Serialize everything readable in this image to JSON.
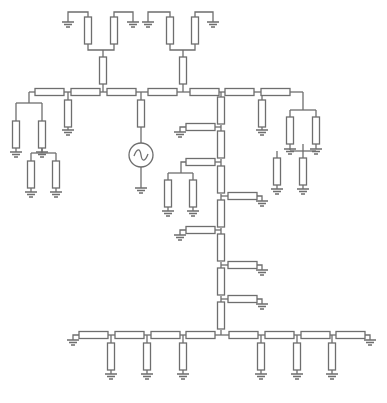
{
  "diagram": {
    "title": "",
    "type": "resistor-ladder-network",
    "stroke_color": "#6e6e6e",
    "background": "#ffffff",
    "source": {
      "kind": "ac-voltage-source",
      "cx": 141,
      "cy": 155,
      "r": 12
    },
    "resistors_h": [
      [
        35,
        92
      ],
      [
        71,
        92
      ],
      [
        107,
        92
      ],
      [
        148,
        92
      ],
      [
        190,
        92
      ],
      [
        225,
        92
      ],
      [
        261,
        92
      ],
      [
        186,
        127
      ],
      [
        186,
        162
      ],
      [
        228,
        196
      ],
      [
        186,
        230
      ],
      [
        228,
        265
      ],
      [
        228,
        299
      ],
      [
        79,
        335
      ],
      [
        115,
        335
      ],
      [
        151,
        335
      ],
      [
        186,
        335
      ],
      [
        229,
        335
      ],
      [
        265,
        335
      ],
      [
        301,
        335
      ],
      [
        336,
        335
      ]
    ],
    "resistors_v": [
      [
        88,
        17
      ],
      [
        114,
        17
      ],
      [
        170,
        17
      ],
      [
        195,
        17
      ],
      [
        103,
        57
      ],
      [
        183,
        57
      ],
      [
        16,
        121
      ],
      [
        42,
        121
      ],
      [
        68,
        100
      ],
      [
        141,
        100
      ],
      [
        31,
        161
      ],
      [
        56,
        161
      ],
      [
        221,
        97
      ],
      [
        221,
        131
      ],
      [
        221,
        166
      ],
      [
        221,
        200
      ],
      [
        221,
        234
      ],
      [
        221,
        268
      ],
      [
        221,
        302
      ],
      [
        168,
        180
      ],
      [
        193,
        180
      ],
      [
        262,
        100
      ],
      [
        290,
        117
      ],
      [
        316,
        117
      ],
      [
        277,
        158
      ],
      [
        303,
        158
      ],
      [
        111,
        343
      ],
      [
        147,
        343
      ],
      [
        183,
        343
      ],
      [
        261,
        343
      ],
      [
        297,
        343
      ],
      [
        332,
        343
      ]
    ],
    "grounds": [
      [
        68,
        22
      ],
      [
        133,
        22
      ],
      [
        148,
        22
      ],
      [
        213,
        22
      ],
      [
        16,
        152
      ],
      [
        42,
        152
      ],
      [
        68,
        130
      ],
      [
        141,
        188
      ],
      [
        31,
        192
      ],
      [
        56,
        192
      ],
      [
        180,
        132
      ],
      [
        168,
        211
      ],
      [
        193,
        211
      ],
      [
        262,
        201
      ],
      [
        180,
        235
      ],
      [
        262,
        270
      ],
      [
        262,
        304
      ],
      [
        262,
        130
      ],
      [
        290,
        149
      ],
      [
        316,
        149
      ],
      [
        277,
        189
      ],
      [
        303,
        189
      ],
      [
        73,
        340
      ],
      [
        370,
        340
      ],
      [
        111,
        374
      ],
      [
        147,
        374
      ],
      [
        183,
        374
      ],
      [
        261,
        374
      ],
      [
        297,
        374
      ],
      [
        332,
        374
      ]
    ],
    "wires": [
      "M68 22 V12 H88 V17",
      "M133 22 V12 H114 V17",
      "M88 44 V50 H114 V44",
      "M103 50 V57",
      "M148 22 V12 H170 V17",
      "M213 22 V12 H195 V17",
      "M170 44 V50 H195 V44",
      "M183 50 V57",
      "M103 84 V92",
      "M183 84 V92",
      "M29 92 H35",
      "M29 92 V103",
      "M16 103 H42",
      "M16 103 V121",
      "M42 103 V121",
      "M64 92 H71",
      "M68 92 V100",
      "M68 127 V130",
      "M100 92 H107",
      "M135 92 H148",
      "M141 92 V100",
      "M141 127 V143",
      "M141 167 V188",
      "M177 92 H190",
      "M218 92 H225",
      "M221 92 V97",
      "M254 92 H261",
      "M262 92 V100",
      "M262 127 V130",
      "M290 92 H303",
      "M303 92 V110",
      "M290 110 H316",
      "M290 110 V117",
      "M316 110 V117",
      "M16 148 V152",
      "M42 148 V152",
      "M42 148 V153",
      "M31 153 H56",
      "M31 153 V161",
      "M56 153 V161",
      "M31 188 V192",
      "M56 188 V192",
      "M221 125 V131",
      "M215 127 H221",
      "M186 127 H180 V132",
      "M221 159 V166",
      "M215 162 H221",
      "M186 162 H181 V173",
      "M168 173 H193",
      "M168 173 V180",
      "M193 173 V180",
      "M168 207 V211",
      "M193 207 V211",
      "M221 194 V200",
      "M221 196 H228",
      "M256 196 H262 V201",
      "M221 228 V234",
      "M215 230 H221",
      "M186 230 H180 V235",
      "M221 262 V268",
      "M221 265 H228",
      "M256 265 H262 V270",
      "M221 296 V302",
      "M221 299 H228",
      "M256 299 H262 V304",
      "M290 144 V150",
      "M316 144 V149",
      "M303 144 V151",
      "M290 151 H316",
      "M277 151 V158",
      "M303 151 V158",
      "M277 185 V189",
      "M303 185 V189",
      "M221 330 V335",
      "M73 340 V335 H79",
      "M108 335 H115",
      "M111 335 V343",
      "M143 335 H151",
      "M147 335 V343",
      "M179 335 H186",
      "M183 335 V343",
      "M215 335 H229",
      "M257 335 H265",
      "M261 335 V343",
      "M294 335 H301",
      "M297 335 V343",
      "M329 335 H336",
      "M332 335 V343",
      "M364 335 H370 V340",
      "M111 370 V374",
      "M147 370 V374",
      "M183 370 V374",
      "M261 370 V374",
      "M297 370 V374",
      "M332 370 V374"
    ]
  }
}
